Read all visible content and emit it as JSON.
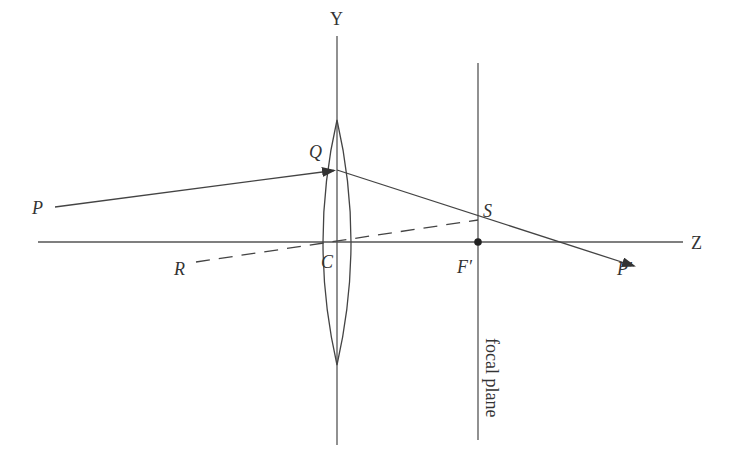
{
  "diagram": {
    "colors": {
      "line": "#444444",
      "text": "#333333",
      "background": "#ffffff"
    },
    "labels": {
      "y_axis": "Y",
      "z_axis": "Z",
      "point_p": "P",
      "point_p_prime": "P′",
      "point_q": "Q",
      "point_r": "R",
      "point_s": "S",
      "point_c": "C",
      "point_f_prime": "F′",
      "focal_plane": "focal plane"
    },
    "elements": [
      {
        "name": "optical-axis-z",
        "type": "line",
        "style": "solid"
      },
      {
        "name": "lens-axis-y",
        "type": "line",
        "style": "solid"
      },
      {
        "name": "focal-plane",
        "type": "line",
        "style": "solid"
      },
      {
        "name": "convex-lens",
        "type": "biconvex-lens"
      },
      {
        "name": "incident-ray",
        "from": "P",
        "to": "Q",
        "arrow": true
      },
      {
        "name": "refracted-ray",
        "from": "Q",
        "to": "P′",
        "arrow": true,
        "passes_through": "S"
      },
      {
        "name": "chief-ray",
        "from": "R",
        "to": "S",
        "style": "dashed",
        "passes_through": "C"
      },
      {
        "name": "focal-point",
        "at": "F′",
        "marker": "dot"
      }
    ]
  }
}
